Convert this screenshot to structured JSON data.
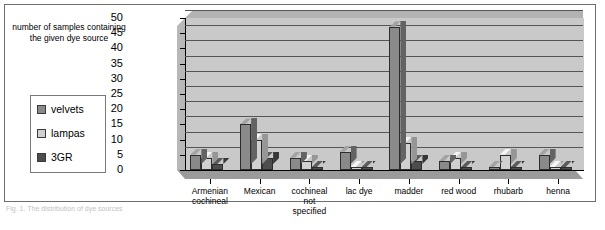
{
  "chart_data": {
    "type": "bar",
    "title": "",
    "ylabel": "number of samples containing the given dye source",
    "xlabel": "",
    "ylim": [
      0,
      50
    ],
    "ytick_step": 5,
    "ytick_labels": [
      "50",
      "45",
      "40",
      "35",
      "30",
      "25",
      "20",
      "15",
      "10",
      "5",
      "0"
    ],
    "grid": true,
    "legend_position": "left",
    "categories": [
      "Armenian cochineal",
      "Mexican",
      "cochineal not specified",
      "lac dye",
      "madder",
      "red wood",
      "rhubarb",
      "henna"
    ],
    "category_lines": [
      [
        "Armenian",
        "cochineal"
      ],
      [
        "Mexican"
      ],
      [
        "cochineal",
        "not",
        "specified"
      ],
      [
        "lac dye"
      ],
      [
        "madder"
      ],
      [
        "red wood"
      ],
      [
        "rhubarb"
      ],
      [
        "henna"
      ]
    ],
    "series": [
      {
        "name": "velvets",
        "color": "#8a8a8a",
        "values": [
          5,
          15,
          4,
          6,
          47,
          3,
          1,
          5
        ]
      },
      {
        "name": "lampas",
        "color": "#d0d0d0",
        "values": [
          4,
          10,
          3,
          1,
          9,
          4,
          5,
          1
        ]
      },
      {
        "name": "3GR",
        "color": "#4d4d4d",
        "values": [
          2,
          4,
          1,
          1,
          3,
          1,
          1,
          1
        ]
      }
    ]
  },
  "legend": {
    "items": [
      {
        "label": "velvets",
        "color": "#8a8a8a"
      },
      {
        "label": "lampas",
        "color": "#d0d0d0"
      },
      {
        "label": "3GR",
        "color": "#4d4d4d"
      }
    ]
  },
  "axis_title": "number of samples containing the given dye source",
  "caption": "Fig. 1. The distribution of dye sources"
}
